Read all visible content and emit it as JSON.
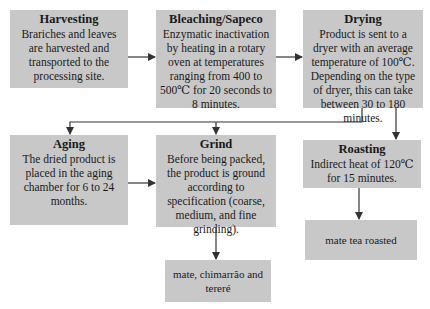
{
  "diagram": {
    "type": "process-flowchart",
    "steps": [
      {
        "id": "harvesting",
        "title": "Harvesting",
        "description": "Brariches and leaves are harvested and transported to the processing site."
      },
      {
        "id": "bleaching",
        "title": "Bleaching/Sapeco",
        "description": "Enzymatic inactivation by heating in a rotary oven at temperatures ranging from 400 to 500℃ for 20 seconds to 8 minutes."
      },
      {
        "id": "drying",
        "title": "Drying",
        "description": "Product is sent to a dryer with an average temperature of 100℃. Depending on the type of dryer, this can take between 30 to 180 minutes."
      },
      {
        "id": "aging",
        "title": "Aging",
        "description": "The dried product is placed in the aging chamber for 6 to 24 months."
      },
      {
        "id": "grind",
        "title": "Grind",
        "description": "Before being packed, the product is ground according to specification (coarse, medium, and fine grinding)."
      },
      {
        "id": "roasting",
        "title": "Roasting",
        "description": "Indirect heat of 120℃ for 15 minutes."
      }
    ],
    "outputs": [
      {
        "id": "mate-chimarrao-terere",
        "label": "mate, chimarrão and tereré"
      },
      {
        "id": "mate-tea-roasted",
        "label": "mate tea roasted"
      }
    ],
    "edges": [
      {
        "from": "harvesting",
        "to": "bleaching"
      },
      {
        "from": "bleaching",
        "to": "drying"
      },
      {
        "from": "drying",
        "to": "aging"
      },
      {
        "from": "drying",
        "to": "grind"
      },
      {
        "from": "drying",
        "to": "roasting"
      },
      {
        "from": "aging",
        "to": "grind"
      },
      {
        "from": "grind",
        "to": "mate-chimarrao-terere"
      },
      {
        "from": "roasting",
        "to": "mate-tea-roasted"
      }
    ],
    "colors": {
      "box_fill": "#c8c8c8",
      "line": "#333333",
      "text": "#1a1a1a"
    }
  }
}
